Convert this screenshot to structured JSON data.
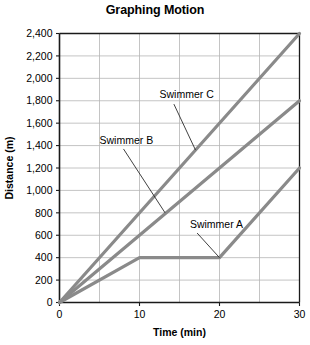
{
  "chart_data": {
    "type": "line",
    "title": "Graphing Motion",
    "xlabel": "Time (min)",
    "ylabel": "Distance (m)",
    "xlim": [
      0,
      30
    ],
    "ylim": [
      0,
      2400
    ],
    "xticks": [
      "0",
      "10",
      "20",
      "30"
    ],
    "xtick_values": [
      0,
      10,
      20,
      30
    ],
    "yticks": [
      "0",
      "200",
      "400",
      "600",
      "800",
      "1,000",
      "1,200",
      "1,400",
      "1,600",
      "1,800",
      "2,000",
      "2,200",
      "2,400"
    ],
    "ytick_values": [
      0,
      200,
      400,
      600,
      800,
      1000,
      1200,
      1400,
      1600,
      1800,
      2000,
      2200,
      2400
    ],
    "grid": true,
    "grid_x_step": 5,
    "grid_y_step": 200,
    "legend": "inline-annotations",
    "line_color": "#8a8a8a",
    "grid_color": "#b5b5b5",
    "axis_color": "#1a1a1a",
    "series": [
      {
        "name": "Swimmer A",
        "x": [
          0,
          10,
          20,
          30
        ],
        "y": [
          0,
          400,
          400,
          1200
        ],
        "label_x": 16.3,
        "label_y": 700,
        "leader_from_x": 17.2,
        "leader_from_y": 620,
        "leader_to_x": 20,
        "leader_to_y": 400
      },
      {
        "name": "Swimmer B",
        "x": [
          0,
          30
        ],
        "y": [
          0,
          1800
        ],
        "label_x": 5.0,
        "label_y": 1450,
        "leader_from_x": 8.0,
        "leader_from_y": 1370,
        "leader_to_x": 13.2,
        "leader_to_y": 800
      },
      {
        "name": "Swimmer C",
        "x": [
          0,
          30
        ],
        "y": [
          0,
          2400
        ],
        "label_x": 12.5,
        "label_y": 1860,
        "leader_from_x": 14.3,
        "leader_from_y": 1770,
        "leader_to_x": 17.0,
        "leader_to_y": 1360
      }
    ]
  }
}
